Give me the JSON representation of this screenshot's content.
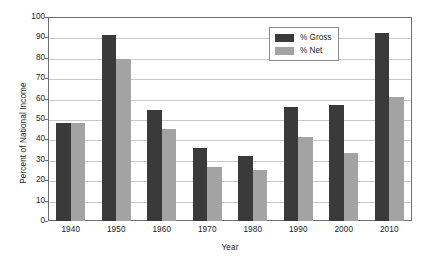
{
  "chart_data": {
    "type": "bar",
    "title": "",
    "xlabel": "Year",
    "ylabel": "Percent of National Income",
    "categories": [
      "1940",
      "1950",
      "1960",
      "1970",
      "1980",
      "1990",
      "2000",
      "2010"
    ],
    "series": [
      {
        "name": "% Gross",
        "color": "#3a3a3a",
        "values": [
          48,
          91,
          54.5,
          36,
          32,
          56,
          57,
          92
        ]
      },
      {
        "name": "% Net",
        "color": "#a3a3a3",
        "values": [
          48,
          79.5,
          45,
          26.5,
          25,
          41,
          33.5,
          61
        ]
      }
    ],
    "ylim": [
      0,
      100
    ],
    "y_ticks": [
      0,
      10,
      20,
      30,
      40,
      50,
      60,
      70,
      80,
      90,
      100
    ],
    "y_tick_labels": [
      "0",
      "10",
      "20",
      "30",
      "40",
      "50",
      "60",
      "70",
      "80",
      "90",
      "100"
    ],
    "grid": true,
    "grid_axis": "y",
    "legend_position": "top-right",
    "legend": [
      {
        "label": "% Gross",
        "color": "#3a3a3a"
      },
      {
        "label": "% Net",
        "color": "#a3a3a3"
      }
    ]
  },
  "colors": {
    "gross": "#3a3a3a",
    "net": "#a3a3a3",
    "gridline": "#c9c9c9",
    "axis": "#6e6e6e",
    "text": "#1a1a1a",
    "background": "#ffffff"
  }
}
